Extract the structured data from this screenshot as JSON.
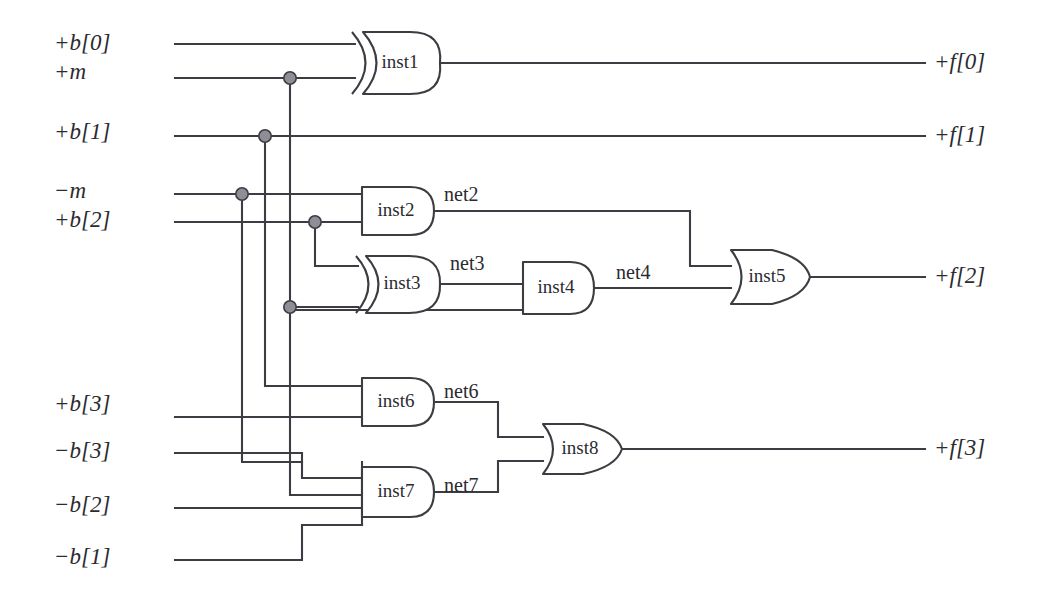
{
  "diagram": {
    "style": {
      "wire_color": "#3c3c42",
      "junction_fill": "#8e8e96",
      "background": "#ffffff",
      "text_color": "#2b2b30"
    }
  },
  "inputs": [
    {
      "id": "in-b0",
      "label": "+b[0]",
      "x": 54,
      "y": 44
    },
    {
      "id": "in-m",
      "label": "+m",
      "x": 54,
      "y": 73
    },
    {
      "id": "in-b1",
      "label": "+b[1]",
      "x": 54,
      "y": 133
    },
    {
      "id": "in-mn",
      "label": "−m",
      "x": 54,
      "y": 192
    },
    {
      "id": "in-b2",
      "label": "+b[2]",
      "x": 54,
      "y": 221
    },
    {
      "id": "in-b3p",
      "label": "+b[3]",
      "x": 54,
      "y": 404
    },
    {
      "id": "in-b3n",
      "label": "−b[3]",
      "x": 54,
      "y": 451
    },
    {
      "id": "in-b2n",
      "label": "−b[2]",
      "x": 54,
      "y": 505
    },
    {
      "id": "in-b1n",
      "label": "−b[1]",
      "x": 54,
      "y": 557
    }
  ],
  "outputs": [
    {
      "id": "out-f0",
      "label": "+f[0]",
      "x": 930,
      "y": 44
    },
    {
      "id": "out-f1",
      "label": "+f[1]",
      "x": 930,
      "y": 133
    },
    {
      "id": "out-f2",
      "label": "+f[2]",
      "x": 930,
      "y": 276
    },
    {
      "id": "out-f3",
      "label": "+f[3]",
      "x": 930,
      "y": 440
    }
  ],
  "gates": [
    {
      "id": "inst1",
      "label": "inst1",
      "type": "xor",
      "inputs": 2,
      "x": 352,
      "y": 32,
      "w": 88,
      "h": 62
    },
    {
      "id": "inst2",
      "label": "inst2",
      "type": "and",
      "inputs": 2,
      "x": 360,
      "y": 187,
      "w": 74,
      "h": 48
    },
    {
      "id": "inst3",
      "label": "inst3",
      "type": "xor",
      "inputs": 2,
      "x": 352,
      "y": 255,
      "w": 88,
      "h": 58
    },
    {
      "id": "inst4",
      "label": "inst4",
      "type": "and",
      "inputs": 2,
      "x": 520,
      "y": 262,
      "w": 74,
      "h": 52
    },
    {
      "id": "inst5",
      "label": "inst5",
      "type": "or",
      "inputs": 2,
      "x": 728,
      "y": 250,
      "w": 82,
      "h": 54
    },
    {
      "id": "inst6",
      "label": "inst6",
      "type": "and",
      "inputs": 2,
      "x": 360,
      "y": 378,
      "w": 74,
      "h": 48
    },
    {
      "id": "inst7",
      "label": "inst7",
      "type": "and",
      "inputs": 4,
      "x": 360,
      "y": 462,
      "w": 74,
      "h": 60
    },
    {
      "id": "inst8",
      "label": "inst8",
      "type": "or",
      "inputs": 2,
      "x": 540,
      "y": 424,
      "w": 82,
      "h": 52
    }
  ],
  "nets": [
    {
      "id": "net2",
      "label": "net2",
      "x": 444,
      "y": 196
    },
    {
      "id": "net3",
      "label": "net3",
      "x": 450,
      "y": 265
    },
    {
      "id": "net4",
      "label": "net4",
      "x": 616,
      "y": 274
    },
    {
      "id": "net6",
      "label": "net6",
      "x": 444,
      "y": 393
    },
    {
      "id": "net7",
      "label": "net7",
      "x": 444,
      "y": 487
    }
  ],
  "junction_count": 5,
  "gate_count": 8,
  "input_count": 9,
  "output_count": 4
}
